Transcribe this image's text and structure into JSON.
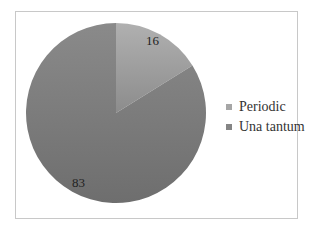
{
  "chart_data": {
    "type": "pie",
    "title": "",
    "categories": [
      "Periodic",
      "Una tantum"
    ],
    "values": [
      16,
      83
    ],
    "data_labels": [
      "16",
      "83"
    ],
    "colors": [
      "#9a9a9a",
      "#7f7f7f"
    ],
    "legend_position": "right",
    "start_angle_deg": 0,
    "direction": "clockwise"
  },
  "legend": {
    "items": [
      {
        "label": "Periodic",
        "color": "#a6a6a6"
      },
      {
        "label": "Una tantum",
        "color": "#858585"
      }
    ]
  },
  "labels": {
    "periodic_value": "16",
    "una_tantum_value": "83"
  }
}
